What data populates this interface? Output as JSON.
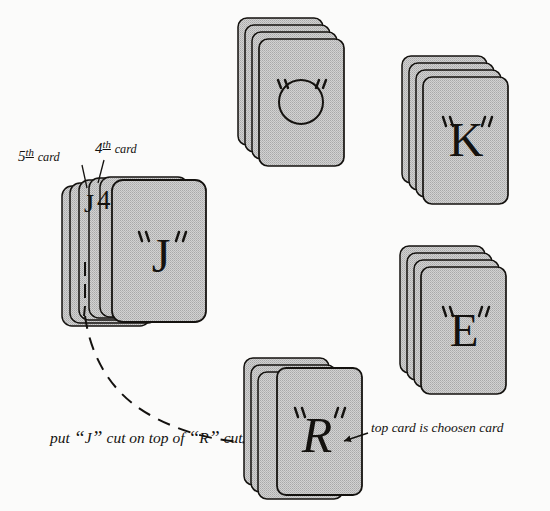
{
  "figure": {
    "background_color": "#fbfbfa",
    "ink_color": "#14120f",
    "card_fill_color": "#c9c9c9",
    "card_edge_color": "#14120f"
  },
  "labels": {
    "fifth_card": {
      "number": "5",
      "ordinal": "th",
      "word": "card"
    },
    "fourth_card": {
      "number": "4",
      "ordinal": "th",
      "word": "card"
    },
    "put_cut": {
      "part1": "put ",
      "q_open_1": "“",
      "letter1": "J",
      "q_close_1": "”",
      "part2": " cut on top of ",
      "q_open_2": "“",
      "letter2": "R",
      "q_close_2": "”",
      "part3": " cut"
    },
    "top_card": "top card is choosen card"
  },
  "markings": {
    "fifth_card_mark": "J",
    "fourth_card_mark": "4"
  },
  "stacks": [
    {
      "id": "stack-o",
      "letter": "O",
      "letter_style": "circle",
      "quotes": true,
      "card_count": 4,
      "x": 238,
      "y": 18,
      "card_w": 85,
      "card_h": 127,
      "dx": 7,
      "dy": 7
    },
    {
      "id": "stack-k",
      "letter": "K",
      "letter_style": "serif",
      "quotes": true,
      "card_count": 4,
      "x": 402,
      "y": 56,
      "card_w": 85,
      "card_h": 127,
      "dx": 7,
      "dy": 7
    },
    {
      "id": "stack-e",
      "letter": "E",
      "letter_style": "serif",
      "quotes": true,
      "card_count": 4,
      "x": 400,
      "y": 246,
      "card_w": 85,
      "card_h": 127,
      "dx": 7,
      "dy": 7
    },
    {
      "id": "stack-r",
      "letter": "R",
      "letter_style": "script",
      "quotes": true,
      "card_count": 4,
      "x": 244,
      "y": 358,
      "card_w": 85,
      "card_h": 127,
      "dx": 7,
      "dy": 7
    },
    {
      "id": "stack-j",
      "letter": "J",
      "letter_style": "serif",
      "quotes": true,
      "card_count": 6,
      "x": 62,
      "y": 180,
      "card_w": 90,
      "card_h": 144,
      "dx": 11,
      "dy": 4
    }
  ],
  "annotations": {
    "curve_note": "dashed arc from J cut down to R cut",
    "arrow_into_r": "arrowhead pointing right into R stack",
    "arrow_to_top_card": "arrowhead pointing left at top card of R stack",
    "leader_5th": "line from 5th card label to J mark",
    "leader_4th": "line from 4th card label to 4 mark",
    "dashed_card_edge": "dashed vertical line on 5th card edge"
  }
}
